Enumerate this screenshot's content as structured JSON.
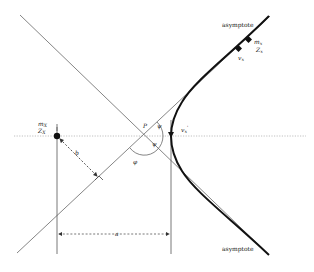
{
  "figure": {
    "type": "hyperbolic-encounter-geometry",
    "labels": {
      "asymptote_top": "asymptote",
      "asymptote_bottom": "asymptote",
      "perturber_mass": "m",
      "perturber_mass_sub": "X",
      "perturber_charge": "Z",
      "perturber_charge_sub": "X",
      "test_mass": "m",
      "test_mass_sub": "x",
      "test_charge": "Z",
      "test_charge_sub": "x",
      "velocity_initial": "v",
      "velocity_initial_sub": "x",
      "velocity_periapsis": "v",
      "velocity_periapsis_sub": "x",
      "velocity_periapsis_sup": "'",
      "point_p": "P",
      "angle_psi_upper": "ψ",
      "angle_psi_lower": "ψ",
      "angle_phi": "φ",
      "impact_parameter": "b",
      "distance_a": "a"
    },
    "colors": {
      "line": "#777777",
      "trajectory": "#111111",
      "dotted": "#aaaaaa",
      "dashed": "#555555",
      "text": "#222222"
    }
  }
}
